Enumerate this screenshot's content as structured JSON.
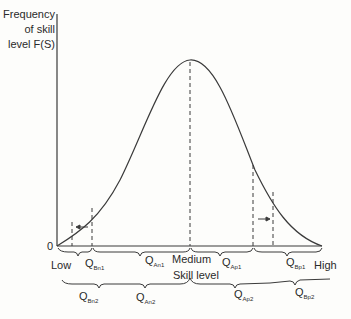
{
  "figure": {
    "y_axis_label_lines": [
      "Frequency",
      "of skill",
      "level F(S)"
    ],
    "origin_label": "0",
    "x_axis": {
      "low_label": "Low",
      "medium_label": "Medium",
      "high_label": "High",
      "title": "Skill level"
    },
    "row1_segments": [
      {
        "main": "Q",
        "sub": "Bn1"
      },
      {
        "main": "Q",
        "sub": "An1"
      },
      {
        "main": "Q",
        "sub": "Ap1"
      },
      {
        "main": "Q",
        "sub": "Bp1"
      }
    ],
    "row2_segments": [
      {
        "main": "Q",
        "sub": "Bn2"
      },
      {
        "main": "Q",
        "sub": "An2"
      },
      {
        "main": "Q",
        "sub": "Ap2"
      },
      {
        "main": "Q",
        "sub": "Bp2"
      }
    ],
    "arrows": [
      {
        "name": "left-shift-arrow",
        "direction": "left"
      },
      {
        "name": "right-shift-arrow",
        "direction": "right"
      }
    ],
    "colors": {
      "line": "#3a3a3a",
      "background": "#fdfdfb"
    }
  }
}
